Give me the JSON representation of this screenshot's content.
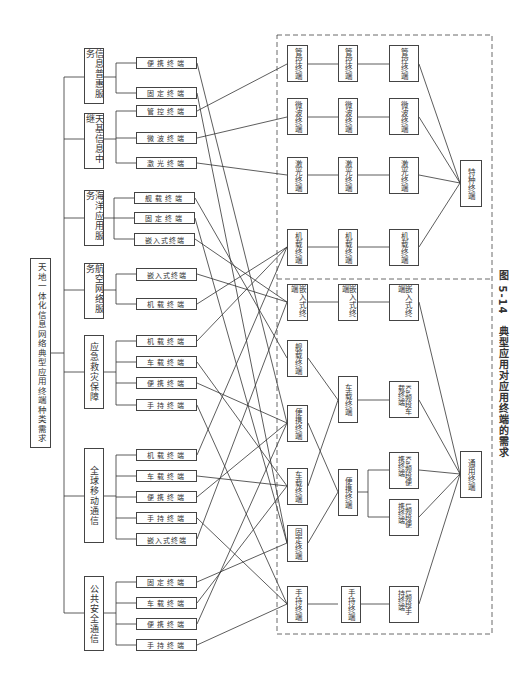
{
  "root": {
    "label": "天地一体化信息网络典型应用终端种类需求"
  },
  "categories": [
    {
      "label": "信息普惠服务"
    },
    {
      "label": "天基信息中继"
    },
    {
      "label": "海洋应用服务"
    },
    {
      "label": "航空网络服务"
    },
    {
      "label": "应急救灾保障"
    },
    {
      "label": "全球移动通信"
    },
    {
      "label": "公共安全通信"
    }
  ],
  "leaves": [
    {
      "label": "便携终端"
    },
    {
      "label": "固定终端"
    },
    {
      "label": "管控终端"
    },
    {
      "label": "微波终端"
    },
    {
      "label": "激光终端"
    },
    {
      "label": "舰载终端"
    },
    {
      "label": "固定终端"
    },
    {
      "label": "嵌入式终端"
    },
    {
      "label": "嵌入式终端"
    },
    {
      "label": "机载终端"
    },
    {
      "label": "机载终端"
    },
    {
      "label": "车载终端"
    },
    {
      "label": "便携终端"
    },
    {
      "label": "手持终端"
    },
    {
      "label": "机载终端"
    },
    {
      "label": "车载终端"
    },
    {
      "label": "便携终端"
    },
    {
      "label": "手持终端"
    },
    {
      "label": "嵌入式终端"
    },
    {
      "label": "固定终端"
    },
    {
      "label": "车载终端"
    },
    {
      "label": "便携终端"
    },
    {
      "label": "手持终端"
    }
  ],
  "col1": [
    {
      "label": "管控终端"
    },
    {
      "label": "微波终端"
    },
    {
      "label": "激光终端"
    },
    {
      "label": "机载终端"
    },
    {
      "label": "嵌入式终端"
    },
    {
      "label": "舰载终端"
    },
    {
      "label": "便携终端"
    },
    {
      "label": "车载终端"
    },
    {
      "label": "固定终端"
    },
    {
      "label": "手持终端"
    }
  ],
  "col2": [
    {
      "label": "管控终端"
    },
    {
      "label": "微波终端"
    },
    {
      "label": "激光终端"
    },
    {
      "label": "机载终端"
    },
    {
      "label": "嵌入式终端"
    },
    {
      "label": "车载终端"
    },
    {
      "label": "便携终端"
    },
    {
      "label": "手持终端"
    }
  ],
  "col3": [
    {
      "label": "管控终端"
    },
    {
      "label": "微波终端"
    },
    {
      "label": "激光终端"
    },
    {
      "label": "机载终端"
    },
    {
      "label": "嵌入式终端"
    },
    {
      "label": "Ka频段车载终端"
    },
    {
      "label": "Ka频段便携终端"
    },
    {
      "label": "L频段便携终端"
    },
    {
      "label": "L频段手持终端"
    }
  ],
  "final": [
    {
      "label": "特种终端"
    },
    {
      "label": "通用终端"
    }
  ],
  "caption": "图 5-14　典型应用对应用终端的需求"
}
